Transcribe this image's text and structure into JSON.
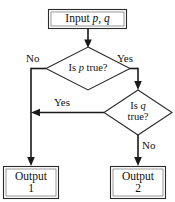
{
  "diagram": {
    "type": "flowchart",
    "colors": {
      "background": "#ffffff",
      "shape_stroke": "#2b2b2b",
      "shape_inner_stroke": "#6e6e6e",
      "edge_stroke": "#1a1a1a",
      "text": "#111111"
    },
    "nodes": {
      "input": {
        "shape": "rectangle",
        "label_prefix": "Input ",
        "var_p": "p",
        "separator": ", ",
        "var_q": "q"
      },
      "decision_p": {
        "shape": "diamond",
        "label_prefix": "Is ",
        "var": "p",
        "label_suffix": " true?"
      },
      "decision_q": {
        "shape": "diamond",
        "label_line1_prefix": "Is ",
        "var": "q",
        "label_line2": "true?"
      },
      "output1": {
        "shape": "rectangle",
        "line1": "Output",
        "line2": "1"
      },
      "output2": {
        "shape": "rectangle",
        "line1": "Output",
        "line2": "2"
      }
    },
    "edge_labels": {
      "p_no": "No",
      "p_yes": "Yes",
      "q_yes": "Yes",
      "q_no": "No"
    }
  }
}
